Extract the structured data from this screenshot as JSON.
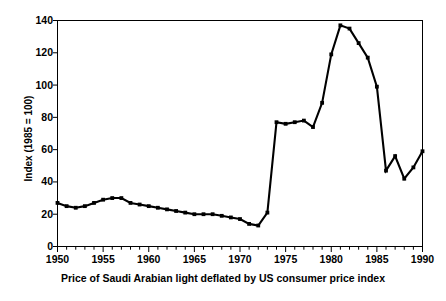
{
  "chart_data": {
    "type": "line",
    "title": "",
    "caption": "Price of Saudi Arabian light deflated by US consumer price index",
    "xlabel": "",
    "ylabel": "Index (1985 = 100)",
    "xlim": [
      1950,
      1990
    ],
    "ylim": [
      0,
      140
    ],
    "yticks": [
      0,
      20,
      40,
      60,
      80,
      100,
      120,
      140
    ],
    "ytick_labels": [
      "0",
      "20",
      "40",
      "60",
      "80",
      "100",
      "120",
      "140"
    ],
    "xticks": [
      1950,
      1955,
      1960,
      1965,
      1970,
      1975,
      1980,
      1985,
      1990
    ],
    "xtick_labels": [
      "1950",
      "1955",
      "1960",
      "1965",
      "1970",
      "1975",
      "1980",
      "1985",
      "1990"
    ],
    "x_minor_tick_interval": 1,
    "grid": false,
    "legend": null,
    "marker": "square",
    "line_color": "#000000",
    "marker_color": "#000000",
    "frame": "box",
    "x": [
      1950,
      1951,
      1952,
      1953,
      1954,
      1955,
      1956,
      1957,
      1958,
      1959,
      1960,
      1961,
      1962,
      1963,
      1964,
      1965,
      1966,
      1967,
      1968,
      1969,
      1970,
      1971,
      1972,
      1973,
      1974,
      1975,
      1976,
      1977,
      1978,
      1979,
      1980,
      1981,
      1982,
      1983,
      1984,
      1985,
      1986,
      1987,
      1988,
      1989,
      1990
    ],
    "values": [
      27,
      25,
      24,
      25,
      27,
      29,
      30,
      30,
      27,
      26,
      25,
      24,
      23,
      22,
      21,
      20,
      20,
      20,
      19,
      18,
      17,
      14,
      13,
      21,
      77,
      76,
      77,
      78,
      74,
      89,
      119,
      137,
      135,
      126,
      117,
      99,
      47,
      56,
      42,
      49,
      59
    ]
  }
}
